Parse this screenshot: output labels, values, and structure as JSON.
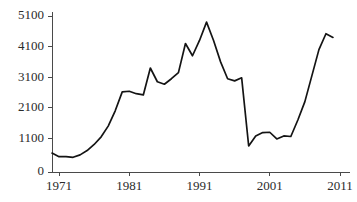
{
  "chart_data": {
    "type": "line",
    "title": "",
    "subtitle": "",
    "xlabel": "",
    "ylabel": "",
    "grid": false,
    "legend": false,
    "legend_position": "none",
    "line_color": "#141414",
    "axis_color": "#4a4a4a",
    "text_color": "#2b2b2b",
    "background": "#ffffff",
    "xlim": [
      1970,
      2011
    ],
    "ylim": [
      0,
      5100
    ],
    "xticks": [
      1971,
      1981,
      1991,
      2001,
      2011
    ],
    "xtick_labels": [
      "1971",
      "1981",
      "1991",
      "2001",
      "2011"
    ],
    "yticks": [
      0,
      1100,
      2100,
      3100,
      4100,
      5100
    ],
    "ytick_labels": [
      "0",
      "1100",
      "2100",
      "3100",
      "4100",
      "5100"
    ],
    "series": [
      {
        "name": "series-1",
        "x": [
          1970,
          1971,
          1972,
          1973,
          1974,
          1975,
          1976,
          1977,
          1978,
          1979,
          1980,
          1981,
          1982,
          1983,
          1984,
          1985,
          1986,
          1987,
          1988,
          1989,
          1990,
          1991,
          1992,
          1993,
          1994,
          1995,
          1996,
          1997,
          1998,
          1999,
          2000,
          2001,
          2002,
          2003,
          2004,
          2005,
          2006,
          2007,
          2008,
          2009,
          2010
        ],
        "y": [
          620,
          500,
          500,
          480,
          560,
          700,
          900,
          1150,
          1500,
          2000,
          2620,
          2640,
          2560,
          2520,
          3400,
          2950,
          2870,
          3050,
          3250,
          4200,
          3800,
          4300,
          4900,
          4300,
          3600,
          3050,
          2980,
          3080,
          850,
          1180,
          1290,
          1300,
          1080,
          1180,
          1160,
          1700,
          2300,
          3150,
          4000,
          4520,
          4400
        ]
      }
    ]
  }
}
